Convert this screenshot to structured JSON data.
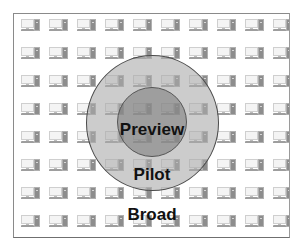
{
  "diagram": {
    "type": "concentric-rings",
    "background_icon": "desktop-computer-icon",
    "icon_grid": {
      "columns": 10,
      "rows": 8
    },
    "rings": [
      {
        "name": "preview",
        "label": "Preview",
        "level": "inner",
        "color": "#a0a0a0"
      },
      {
        "name": "pilot",
        "label": "Pilot",
        "level": "middle",
        "color": "#c8c8c8"
      },
      {
        "name": "broad",
        "label": "Broad",
        "level": "outer",
        "color": "#ffffff"
      }
    ],
    "caption": ""
  },
  "colors": {
    "frame_border": "#8a8a8a",
    "ring_stroke": "#4a4a4a",
    "label_text": "#111111"
  }
}
